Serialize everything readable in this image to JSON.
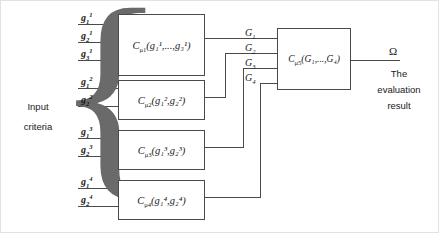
{
  "figure": {
    "input_label_line1": "Input",
    "input_label_line2": "criteria",
    "brace_glyph": "{",
    "output_symbol": "Ω",
    "output_caption_line1": "The",
    "output_caption_line2": "evaluation",
    "output_caption_line3": "result",
    "line_color": "#4a4a4a",
    "text_color": "#1a1a1a",
    "background": "#ffffff"
  },
  "inputs": [
    {
      "name": "g-1-1",
      "base": "g",
      "sub": "1",
      "sup": "1"
    },
    {
      "name": "g-2-1",
      "base": "g",
      "sub": "2",
      "sup": "1"
    },
    {
      "name": "g-3-1",
      "base": "g",
      "sub": "3",
      "sup": "1"
    },
    {
      "name": "g-1-2",
      "base": "g",
      "sub": "1",
      "sup": "2"
    },
    {
      "name": "g-2-2",
      "base": "g",
      "sub": "2",
      "sup": "2"
    },
    {
      "name": "g-1-3",
      "base": "g",
      "sub": "1",
      "sup": "3"
    },
    {
      "name": "g-2-3",
      "base": "g",
      "sub": "2",
      "sup": "3"
    },
    {
      "name": "g-1-4",
      "base": "g",
      "sub": "1",
      "sup": "4"
    },
    {
      "name": "g-2-4",
      "base": "g",
      "sub": "2",
      "sup": "4"
    }
  ],
  "aggregators": [
    {
      "id": "block-1",
      "operator": "C",
      "measure": "μ",
      "measure_index": "1",
      "args": "(g₁¹,...,g₃¹)",
      "output": "G₁"
    },
    {
      "id": "block-2",
      "operator": "C",
      "measure": "μ",
      "measure_index": "2",
      "args": "(g₁²,g₂²)",
      "output": "G₂"
    },
    {
      "id": "block-3",
      "operator": "C",
      "measure": "μ",
      "measure_index": "3",
      "args": "(g₁³,g₂³)",
      "output": "G₃"
    },
    {
      "id": "block-4",
      "operator": "C",
      "measure": "μ",
      "measure_index": "4",
      "args": "(g₁⁴,g₂⁴)",
      "output": "G₄"
    }
  ],
  "final_aggregator": {
    "id": "block-final",
    "operator": "C",
    "measure": "μ",
    "measure_index": "5",
    "args": "(G₁,...,G₄)"
  },
  "intermediate_signals": [
    {
      "label": "G",
      "index": "1"
    },
    {
      "label": "G",
      "index": "2"
    },
    {
      "label": "G",
      "index": "3"
    },
    {
      "label": "G",
      "index": "4"
    }
  ]
}
